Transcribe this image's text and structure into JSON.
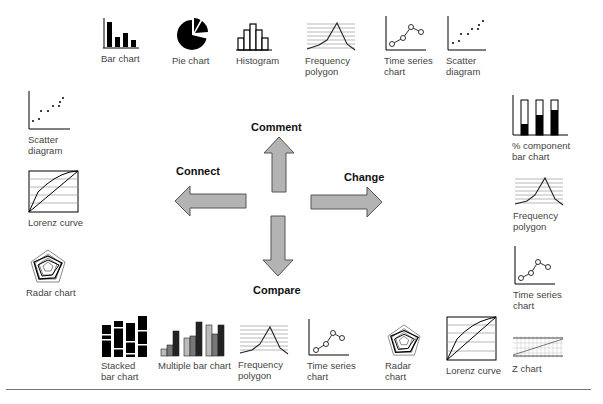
{
  "directions": {
    "comment": "Comment",
    "connect": "Connect",
    "change": "Change",
    "compare": "Compare"
  },
  "top_row": [
    {
      "label": "Bar chart",
      "icon": "bar-chart-icon"
    },
    {
      "label": "Pie chart",
      "icon": "pie-chart-icon"
    },
    {
      "label": "Histogram",
      "icon": "histogram-icon"
    },
    {
      "label": "Frequency\npolygon",
      "icon": "frequency-polygon-icon"
    },
    {
      "label": "Time series\nchart",
      "icon": "time-series-icon"
    },
    {
      "label": "Scatter\ndiagram",
      "icon": "scatter-diagram-icon"
    }
  ],
  "left_column": [
    {
      "label": "Scatter\ndiagram",
      "icon": "scatter-diagram-icon"
    },
    {
      "label": "Lorenz curve",
      "icon": "lorenz-curve-icon"
    },
    {
      "label": "Radar chart",
      "icon": "radar-chart-icon"
    }
  ],
  "right_column": [
    {
      "label": "% component\nbar chart",
      "icon": "percent-component-bar-icon"
    },
    {
      "label": "Frequency\npolygon",
      "icon": "frequency-polygon-icon"
    },
    {
      "label": "Time series\nchart",
      "icon": "time-series-icon"
    }
  ],
  "bottom_row": [
    {
      "label": "Stacked\nbar chart",
      "icon": "stacked-bar-icon"
    },
    {
      "label": "Multiple bar chart",
      "icon": "multiple-bar-icon"
    },
    {
      "label": "Frequency\npolygon",
      "icon": "frequency-polygon-icon"
    },
    {
      "label": "Time series\nchart",
      "icon": "time-series-icon"
    },
    {
      "label": "Radar\nchart",
      "icon": "radar-chart-icon"
    },
    {
      "label": "Lorenz curve",
      "icon": "lorenz-curve-icon"
    },
    {
      "label": "Z chart",
      "icon": "z-chart-icon"
    }
  ],
  "colors": {
    "arrow_fill": "#b3b3b3",
    "arrow_stroke": "#555555",
    "label": "#444444"
  }
}
